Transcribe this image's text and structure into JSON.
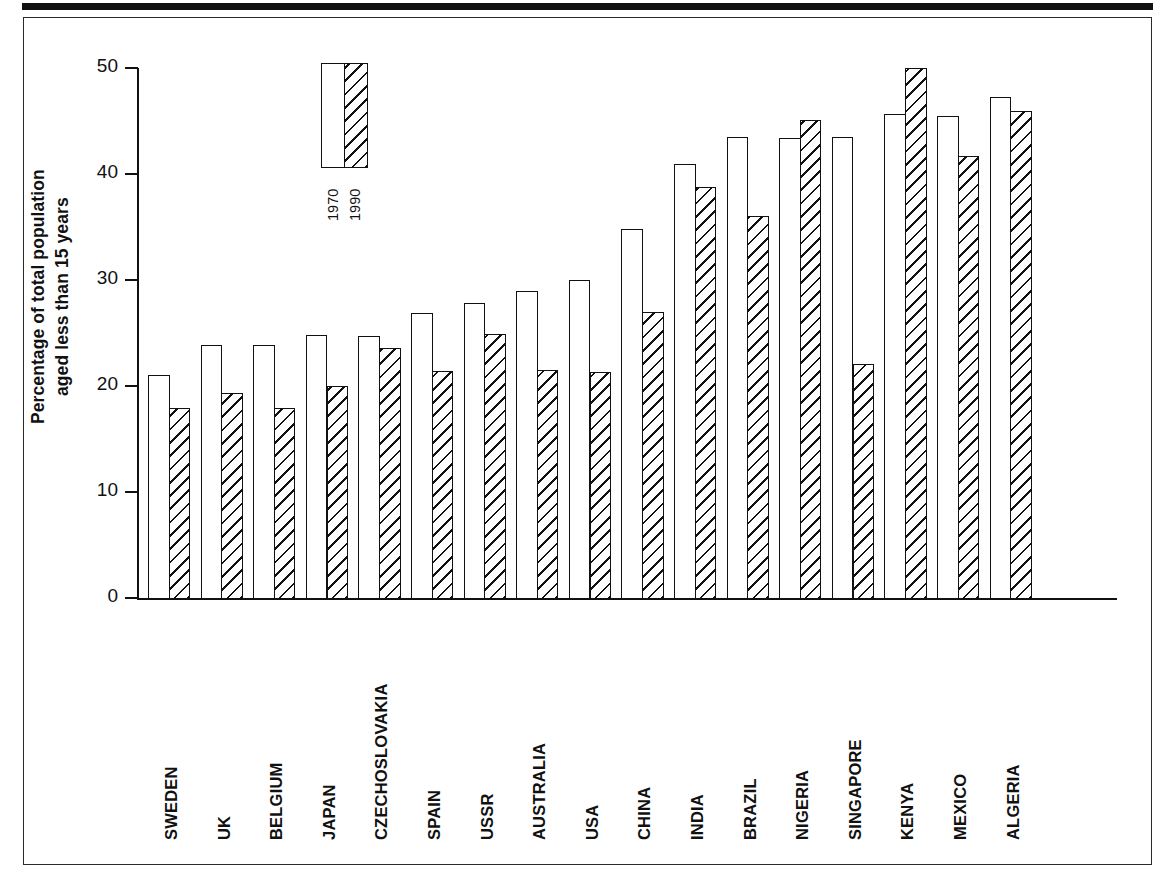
{
  "figure": {
    "frame": "bordered-figure-box",
    "top_rule": "thick-horizontal-rule"
  },
  "legend": {
    "entries": [
      {
        "label": "1970",
        "style": "outline"
      },
      {
        "label": "1990",
        "style": "hatched"
      }
    ]
  },
  "chart_data": {
    "type": "bar",
    "title": "",
    "subtitle": "",
    "xlabel": "",
    "ylabel": "Percentage of total population aged less than 15 years",
    "ylabel_lines": [
      "Percentage of total population",
      "aged less than 15 years"
    ],
    "ylim": [
      0,
      50
    ],
    "yticks": [
      0,
      10,
      20,
      30,
      40,
      50
    ],
    "ytick_labels": [
      "0",
      "10",
      "20",
      "30",
      "40",
      "50"
    ],
    "grid": false,
    "legend_position": "inside-top-left",
    "categories": [
      "SWEDEN",
      "UK",
      "BELGIUM",
      "JAPAN",
      "CZECHOSLOVAKIA",
      "SPAIN",
      "USSR",
      "AUSTRALIA",
      "USA",
      "CHINA",
      "INDIA",
      "BRAZIL",
      "NIGERIA",
      "SINGAPORE",
      "KENYA",
      "MEXICO",
      "ALGERIA"
    ],
    "series": [
      {
        "name": "1970",
        "style": "outline",
        "values": [
          21.0,
          23.9,
          23.9,
          24.8,
          24.7,
          26.9,
          27.8,
          29.0,
          30.0,
          34.8,
          40.9,
          43.5,
          43.4,
          43.5,
          45.7,
          45.5,
          47.3
        ]
      },
      {
        "name": "1990",
        "style": "hatched",
        "values": [
          17.9,
          19.3,
          17.9,
          20.0,
          23.6,
          21.4,
          24.9,
          21.5,
          21.3,
          27.0,
          38.8,
          36.0,
          45.1,
          22.1,
          50.0,
          41.7,
          45.9
        ]
      }
    ],
    "colors": {
      "axis": "#111111",
      "bar_outline": "#111111",
      "bar_fill_1970": "#ffffff",
      "bar_fill_1990": "#ffffff",
      "hatch": "#111111",
      "background": "#ffffff"
    }
  }
}
